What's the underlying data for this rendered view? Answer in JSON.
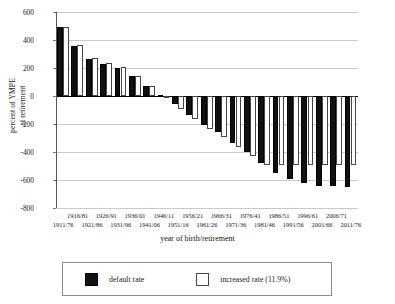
{
  "chart_data": {
    "type": "bar",
    "title": "",
    "xlabel": "year of birth/retirement",
    "ylabel": "percent of YMPE at retirement",
    "ylabel_lines": [
      "percent of YMPE",
      "at retirement"
    ],
    "ylim": [
      -800,
      600
    ],
    "ytick_step": 200,
    "yticks": [
      600,
      400,
      200,
      0,
      -200,
      -400,
      -600,
      -800
    ],
    "ytick_labels": [
      "600",
      "400",
      "200",
      "0",
      "-200",
      "-400",
      "-600",
      "-800"
    ],
    "grid": true,
    "grid_axis": "y",
    "legend_position": "bottom",
    "categories": [
      "1911/76",
      "1916/81",
      "1921/86",
      "1926/91",
      "1931/96",
      "1936/01",
      "1941/06",
      "1946/11",
      "1951/16",
      "1956/21",
      "1961/26",
      "1966/31",
      "1971/36",
      "1976/41",
      "1981/46",
      "1986/51",
      "1991/56",
      "1996/61",
      "2001/66",
      "2006/71",
      "2011/76"
    ],
    "categories_row_top": [
      "1916/81",
      "1926/91",
      "1936/01",
      "1946/11",
      "1956/21",
      "1966/31",
      "1976/41",
      "1986/51",
      "1996/61",
      "2006/71"
    ],
    "categories_row_bottom": [
      "1911/76",
      "1921/86",
      "1931/96",
      "1941/06",
      "1951/16",
      "1961/26",
      "1971/36",
      "1981/46",
      "1991/56",
      "2001/66",
      "2011/76"
    ],
    "series": [
      {
        "name": "default rate",
        "color": "#111111",
        "values": [
          490,
          360,
          265,
          232,
          200,
          140,
          72,
          5,
          -55,
          -135,
          -205,
          -255,
          -335,
          -400,
          -480,
          -550,
          -590,
          -620,
          -640,
          -640,
          -650
        ]
      },
      {
        "name": "increased rate (11.9%)",
        "color": "#ffffff",
        "values": [
          490,
          362,
          270,
          237,
          208,
          145,
          75,
          3,
          -90,
          -165,
          -235,
          -290,
          -365,
          -430,
          -490,
          -490,
          -490,
          -490,
          -490,
          -490,
          -490
        ]
      }
    ]
  },
  "legend": {
    "items": [
      {
        "label": "default rate",
        "swatch": "dark"
      },
      {
        "label": "increased rate (11.9%)",
        "swatch": "light"
      }
    ]
  }
}
